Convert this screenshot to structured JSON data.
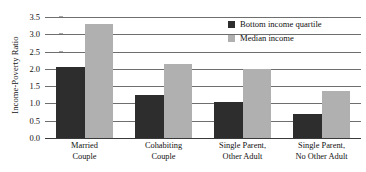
{
  "chart_data": {
    "type": "bar",
    "title": "",
    "xlabel": "",
    "ylabel": "Income-Poverty Ratio",
    "ylim": [
      0.0,
      3.5
    ],
    "ytick_labels": [
      "0.0",
      "0.5",
      "1.0",
      "1.5",
      "2.0",
      "2.5",
      "3.0",
      "3.5"
    ],
    "ytick_values": [
      0.0,
      0.5,
      1.0,
      1.5,
      2.0,
      2.5,
      3.0,
      3.5
    ],
    "grid": "horizontal",
    "legend_position": "top-right",
    "categories": [
      "Married Couple",
      "Cohabiting Couple",
      "Single Parent, Other Adult",
      "Single Parent, No Other Adult"
    ],
    "category_lines": [
      [
        "Married",
        "Couple"
      ],
      [
        "Cohabiting",
        "Couple"
      ],
      [
        "Single Parent,",
        "Other Adult"
      ],
      [
        "Single Parent,",
        "No Other Adult"
      ]
    ],
    "series": [
      {
        "name": "Bottom income quartile",
        "color": "#2d2d2d",
        "values": [
          2.05,
          1.25,
          1.05,
          0.7
        ]
      },
      {
        "name": "Median income",
        "color": "#b0b0b0",
        "values": [
          3.3,
          2.15,
          2.0,
          1.35
        ]
      }
    ]
  },
  "legend": {
    "entries": [
      {
        "label": "Bottom income quartile",
        "swatch": "dark"
      },
      {
        "label": "Median income",
        "swatch": "light"
      }
    ]
  },
  "colors": {
    "dark_bar": "#2d2d2d",
    "light_bar": "#b0b0b0",
    "gridline": "#6e6e6e",
    "axis": "#3a3a3a",
    "text": "#111111",
    "background": "#ffffff"
  }
}
